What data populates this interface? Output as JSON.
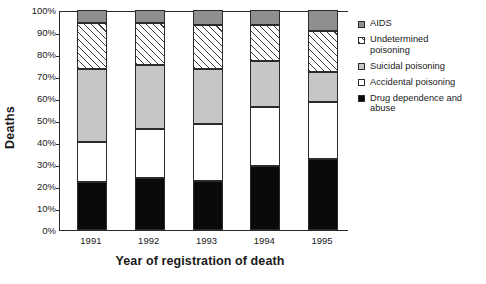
{
  "chart_data": {
    "type": "bar",
    "subtype": "stacked-percentage",
    "title": "",
    "xlabel": "Year of registration of death",
    "ylabel": "Deaths",
    "categories": [
      "1991",
      "1992",
      "1993",
      "1994",
      "1995"
    ],
    "ylim": [
      0,
      100
    ],
    "ytick_labels": [
      "0%",
      "10%",
      "20%",
      "30%",
      "40%",
      "50%",
      "60%",
      "70%",
      "80%",
      "90%",
      "100%"
    ],
    "ytick_values": [
      0,
      10,
      20,
      30,
      40,
      50,
      60,
      70,
      80,
      90,
      100
    ],
    "grid": false,
    "legend_position": "right",
    "series": [
      {
        "name": "Drug dependence and abuse",
        "fill": "solid-black",
        "color": "#0a0a0a",
        "values": [
          22,
          23.5,
          22.5,
          29,
          32.5
        ]
      },
      {
        "name": "Accidental poisoning",
        "fill": "solid-white",
        "color": "#ffffff",
        "values": [
          18,
          22.5,
          25.5,
          27,
          25.5
        ]
      },
      {
        "name": "Suicidal poisoning",
        "fill": "solid-light-gray",
        "color": "#c6c6c6",
        "values": [
          33,
          29,
          25,
          21,
          14
        ]
      },
      {
        "name": "Undetermined poisoning",
        "fill": "diagonal-hatch",
        "color": "#ffffff",
        "values": [
          21,
          19,
          20,
          16,
          18.5
        ]
      },
      {
        "name": "AIDS",
        "fill": "solid-dark-gray",
        "color": "#8f8f8f",
        "values": [
          6,
          6,
          7,
          7,
          9.5
        ]
      }
    ],
    "cumulative_tops": {
      "1991": [
        22,
        40,
        73,
        94,
        100
      ],
      "1992": [
        23.5,
        46,
        75,
        94,
        100
      ],
      "1993": [
        22.5,
        48,
        73,
        93,
        100
      ],
      "1994": [
        29,
        56,
        77,
        93,
        100
      ],
      "1995": [
        32.5,
        58,
        72,
        90.5,
        100
      ]
    }
  },
  "legend": {
    "items": [
      {
        "label": "AIDS",
        "swatch": "solid-dark-gray"
      },
      {
        "label": "Undetermined\npoisoning",
        "swatch": "diagonal-hatch"
      },
      {
        "label": "Suicidal poisoning",
        "swatch": "solid-light-gray"
      },
      {
        "label": "Accidental poisoning",
        "swatch": "solid-white"
      },
      {
        "label": "Drug dependence and\nabuse",
        "swatch": "solid-black"
      }
    ]
  }
}
